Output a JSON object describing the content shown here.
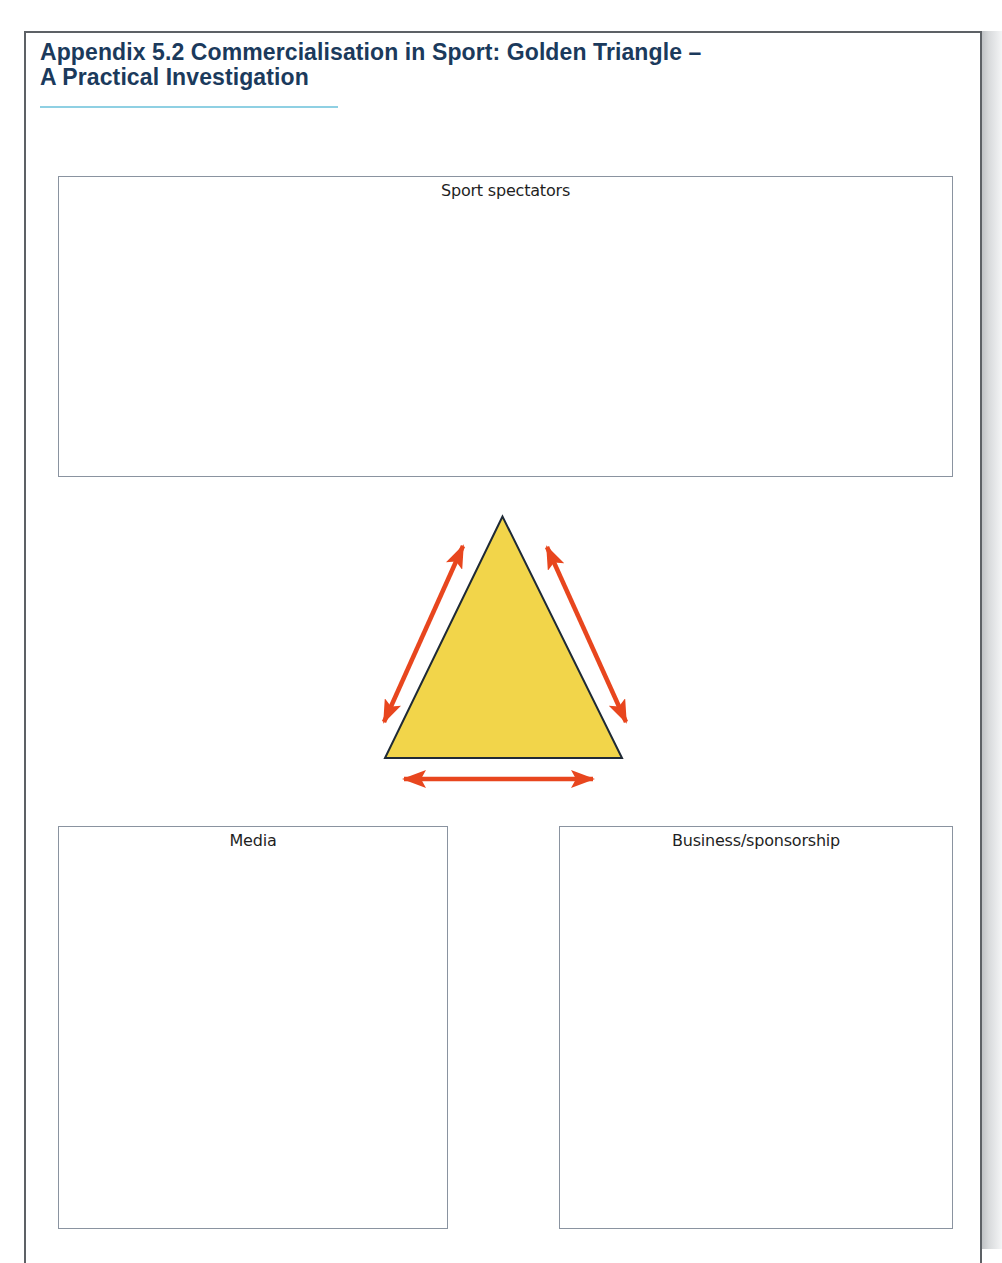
{
  "document": {
    "title_line1": "Appendix 5.2 Commercialisation in Sport: Golden Triangle –",
    "title_line2": "A Practical Investigation"
  },
  "boxes": {
    "top": {
      "label": "Sport spectators"
    },
    "bottom_left": {
      "label": "Media"
    },
    "bottom_right": {
      "label": "Business/sponsorship"
    }
  },
  "diagram": {
    "shape": "golden-triangle",
    "fill_color": "#F2D54A",
    "stroke_color": "#1f2a36",
    "arrow_color": "#E8461E",
    "arrows": [
      {
        "name": "spectators-media",
        "direction": "bidirectional"
      },
      {
        "name": "spectators-business",
        "direction": "bidirectional"
      },
      {
        "name": "media-business",
        "direction": "bidirectional"
      }
    ]
  },
  "colors": {
    "title": "#1B3A5C",
    "title_underline": "#8FD0E3",
    "box_border": "#8A93A0"
  }
}
